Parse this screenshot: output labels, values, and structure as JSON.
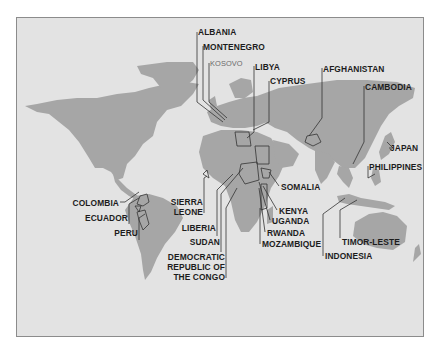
{
  "map": {
    "type": "world-map",
    "colors": {
      "page_background": "#ffffff",
      "ocean": "#e3e3e3",
      "land": "#a6a6a6",
      "frame_border": "#8c8c8c",
      "leader_lines": "#333333",
      "label_text": "#1c1c1c",
      "kosovo_text": "#6a6a6a"
    },
    "labels": {
      "albania": "ALBANIA",
      "montenegro": "MONTENEGRO",
      "kosovo": "KOSOVO",
      "libya": "LIBYA",
      "cyprus": "CYPRUS",
      "afghanistan": "AFGHANISTAN",
      "cambodia": "CAMBODIA",
      "japan": "JAPAN",
      "philippines": "PHILIPPINES",
      "somalia": "SOMALIA",
      "kenya": "KENYA",
      "uganda": "UGANDA",
      "rwanda": "RWANDA",
      "mozambique": "MOZAMBIQUE",
      "timor_leste": "TIMOR-LESTE",
      "indonesia": "INDONESIA",
      "colombia": "COLOMBIA",
      "ecuador": "ECUADOR",
      "peru": "PERU",
      "sierra_leone_1": "SIERRA",
      "sierra_leone_2": "LEONE",
      "liberia": "LIBERIA",
      "sudan": "SUDAN",
      "drc_1": "DEMOCRATIC",
      "drc_2": "REPUBLIC OF",
      "drc_3": "THE CONGO"
    }
  }
}
